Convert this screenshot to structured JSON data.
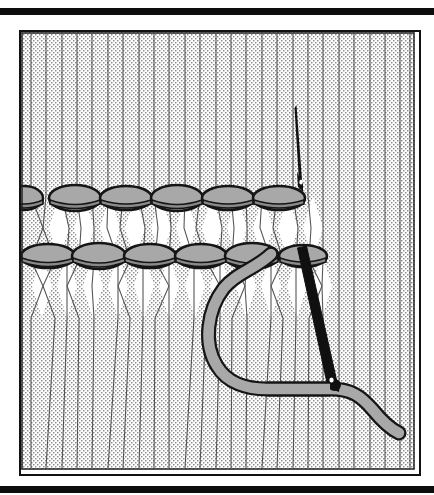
{
  "figure": {
    "kind": "line-illustration",
    "title": "",
    "caption": "",
    "rules": [
      {
        "name": "top-rule",
        "color": "#0d0d0d"
      },
      {
        "name": "bottom-rule",
        "color": "#0d0d0d"
      }
    ],
    "frame": {
      "border_color": "#111111",
      "background": "#ffffff"
    },
    "colors": {
      "outline": "#151515",
      "fabric_stipple": "#8d8d8d",
      "fabric_ground": "#ffffff",
      "knot_fill": "#a8a8a8",
      "knot_shadow": "#8f8f8f",
      "thread_fill": "#a8a8a8",
      "needle_fill": "#0d0d0d"
    },
    "fabric": {
      "warp_count": 26,
      "stipple": "dotted-halftone"
    },
    "stitch_rows": [
      {
        "name": "upper-knot-row",
        "y": 196,
        "knots": [
          {
            "cx": 22,
            "cy": 196,
            "rx": 19,
            "ry": 12,
            "clipped": true
          },
          {
            "cx": 73,
            "cy": 196,
            "rx": 26,
            "ry": 13,
            "clipped": false
          },
          {
            "cx": 124,
            "cy": 196,
            "rx": 26,
            "ry": 12,
            "clipped": false
          },
          {
            "cx": 175,
            "cy": 196,
            "rx": 26,
            "ry": 13,
            "clipped": false
          },
          {
            "cx": 226,
            "cy": 196,
            "rx": 26,
            "ry": 12,
            "clipped": false
          },
          {
            "cx": 277,
            "cy": 196,
            "rx": 26,
            "ry": 12,
            "clipped": false
          }
        ]
      },
      {
        "name": "lower-knot-row",
        "y": 254,
        "knots": [
          {
            "cx": 46,
            "cy": 254,
            "rx": 27,
            "ry": 12,
            "clipped": false
          },
          {
            "cx": 97,
            "cy": 254,
            "rx": 27,
            "ry": 13,
            "clipped": false
          },
          {
            "cx": 148,
            "cy": 254,
            "rx": 26,
            "ry": 12,
            "clipped": false
          },
          {
            "cx": 199,
            "cy": 254,
            "rx": 26,
            "ry": 12,
            "clipped": false
          },
          {
            "cx": 250,
            "cy": 254,
            "rx": 27,
            "ry": 13,
            "clipped": false
          },
          {
            "cx": 301,
            "cy": 254,
            "rx": 24,
            "ry": 11,
            "clipped": false
          }
        ]
      }
    ],
    "needle": {
      "name": "sewing-needle",
      "tip_x": 294,
      "tip_y": 103,
      "eye_x": 299,
      "eye_y": 178,
      "shaft_top_x": 308,
      "shaft_top_y": 246,
      "shaft_bottom_x": 336,
      "shaft_bottom_y": 383,
      "width": 8,
      "color": "#0d0d0d"
    },
    "working_thread": {
      "name": "working-thread-loop",
      "width": 11,
      "fill": "#a8a8a8",
      "outline": "#151515",
      "path": "loops from lower-knot-row under needle and exits right"
    }
  }
}
